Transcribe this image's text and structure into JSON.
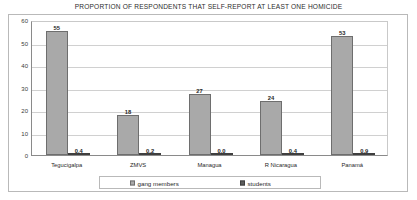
{
  "chart_data": {
    "type": "bar",
    "title": "PROPORTION OF RESPONDENTS THAT SELF-REPORT AT LEAST ONE HOMICIDE",
    "xlabel": "",
    "ylabel": "%",
    "ylim": [
      0,
      60
    ],
    "yticks": [
      60,
      50,
      40,
      30,
      20,
      10,
      0
    ],
    "ytick_labels": [
      "60",
      "50",
      "40",
      "30",
      "20",
      "10",
      "0"
    ],
    "grid": true,
    "legend_position": "bottom",
    "categories": [
      "Tegucigalpa",
      "ZMVS",
      "Managua",
      "R Nicaragua",
      "Panamá"
    ],
    "series": [
      {
        "name": "gang members",
        "color": "#a9a9a9",
        "values": [
          55,
          18,
          27,
          24,
          53
        ],
        "value_labels": [
          "55",
          "18",
          "27",
          "24",
          "53"
        ]
      },
      {
        "name": "students",
        "color": "#5c5c5c",
        "values": [
          0.4,
          0.2,
          0.0,
          0.4,
          0.9
        ],
        "value_labels": [
          "0,4",
          "0,2",
          "0,0",
          "0,4",
          "0,9"
        ]
      }
    ]
  }
}
